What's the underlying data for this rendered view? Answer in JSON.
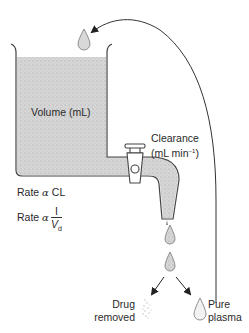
{
  "diagram": {
    "type": "one-compartment clearance model",
    "colors": {
      "fill": "#d4d4d4",
      "stroke": "#444444",
      "text": "#2a2a2a"
    },
    "labels": {
      "volume": "Volume (mL)",
      "clearance_line1": "Clearance",
      "clearance_line2_prefix": "(mL min",
      "clearance_line2_sup": "−1",
      "clearance_line2_suffix": ")",
      "rate_cl_prefix": "Rate ",
      "rate_cl_symbol": "α",
      "rate_cl_suffix": " CL",
      "rate_vd_prefix": "Rate ",
      "rate_vd_symbol": "α",
      "rate_vd_numerator": "I",
      "rate_vd_denominator": "V",
      "rate_vd_denominator_sub": "d",
      "drug_removed_line1": "Drug",
      "drug_removed_line2": "removed",
      "pure_plasma_line1": "Pure",
      "pure_plasma_line2": "plasma"
    }
  }
}
